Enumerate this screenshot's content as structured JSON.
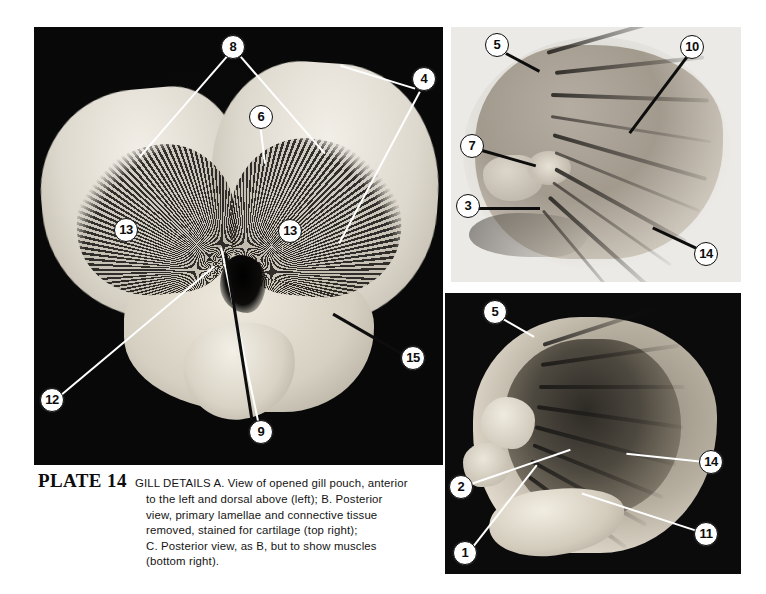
{
  "plate": {
    "label": "PLATE 14",
    "subject": "GILL DETAILS",
    "caption_lines": [
      "GILL DETAILS   A.  View of opened gill pouch, anterior",
      "to the left and dorsal above (left); B. Posterior",
      "view,  primary  lamellae  and  connective  tissue",
      "removed,  stained  for  cartilage  (top  right);",
      "C. Posterior  view,  as B,  but  to  show  muscles",
      "(bottom right)."
    ]
  },
  "panels": [
    {
      "id": "panel-a",
      "letter": "A",
      "description": "View of opened gill pouch, anterior to the left and dorsal above",
      "position": "left",
      "background": "#0a0a0a",
      "callouts": [
        {
          "number": "8",
          "x": 233,
          "y": 47,
          "style": "light"
        },
        {
          "number": "4",
          "x": 424,
          "y": 79,
          "style": "light"
        },
        {
          "number": "6",
          "x": 261,
          "y": 117,
          "style": "light"
        },
        {
          "number": "13",
          "x": 126,
          "y": 230,
          "style": "dark"
        },
        {
          "number": "13",
          "x": 290,
          "y": 231,
          "style": "dark"
        },
        {
          "number": "15",
          "x": 413,
          "y": 358,
          "style": "light"
        },
        {
          "number": "12",
          "x": 52,
          "y": 400,
          "style": "light"
        },
        {
          "number": "9",
          "x": 261,
          "y": 432,
          "style": "light"
        }
      ]
    },
    {
      "id": "panel-b",
      "letter": "B",
      "description": "Posterior view, primary lamellae and connective tissue removed, stained for cartilage",
      "position": "top right",
      "background": "#eceae6",
      "callouts": [
        {
          "number": "5",
          "x": 497,
          "y": 45,
          "style": "dark"
        },
        {
          "number": "10",
          "x": 692,
          "y": 47,
          "style": "dark"
        },
        {
          "number": "7",
          "x": 472,
          "y": 146,
          "style": "dark"
        },
        {
          "number": "3",
          "x": 468,
          "y": 206,
          "style": "dark"
        },
        {
          "number": "14",
          "x": 706,
          "y": 254,
          "style": "dark"
        }
      ]
    },
    {
      "id": "panel-c",
      "letter": "C",
      "description": "Posterior view, as B, but to show muscles",
      "position": "bottom right",
      "background": "#0b0b0b",
      "callouts": [
        {
          "number": "5",
          "x": 495,
          "y": 312,
          "style": "light"
        },
        {
          "number": "14",
          "x": 711,
          "y": 462,
          "style": "light"
        },
        {
          "number": "2",
          "x": 461,
          "y": 487,
          "style": "light"
        },
        {
          "number": "11",
          "x": 706,
          "y": 534,
          "style": "light"
        },
        {
          "number": "1",
          "x": 465,
          "y": 553,
          "style": "light"
        }
      ]
    }
  ],
  "colors": {
    "page_background": "#ffffff",
    "dark_field": "#0a0a0a",
    "light_field": "#eceae6",
    "ink": "#0d0d0d",
    "leader_light": "#ffffff"
  }
}
